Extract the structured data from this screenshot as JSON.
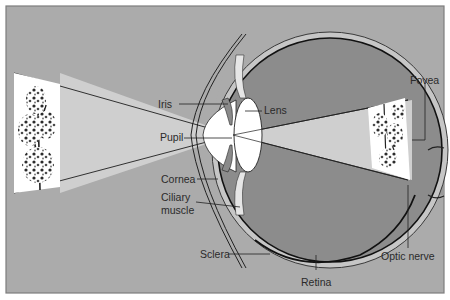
{
  "diagram": {
    "colors": {
      "frame_bg": "#ababab",
      "frame_border": "#7d7d7d",
      "light_cone": "#cfcfcf",
      "vitreous": "#8c8c8c",
      "sclera_band": "#c8c8c8",
      "line": "#1e1e1e",
      "lens": "#ffffff"
    },
    "labels": {
      "iris": "Iris",
      "pupil": "Pupil",
      "lens": "Lens",
      "cornea": "Cornea",
      "ciliary_line1": "Ciliary",
      "ciliary_line2": "muscle",
      "sclera": "Sclera",
      "retina": "Retina",
      "fovea": "Fovea",
      "optic_nerve": "Optic nerve"
    },
    "objects": {
      "source_image": "tree (upright object)",
      "retinal_image": "tree (inverted image on retina)"
    }
  }
}
